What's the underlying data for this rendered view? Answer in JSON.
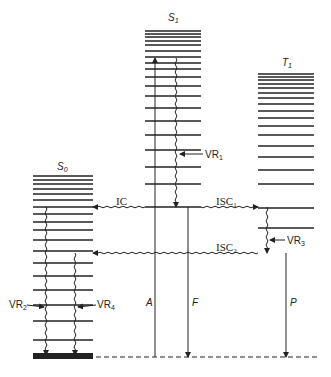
{
  "diagram": {
    "type": "jablonski",
    "colors": {
      "line": "#222222",
      "background": "#ffffff"
    },
    "states": [
      {
        "id": "S0",
        "label": "S",
        "sub": "0",
        "x1": 33,
        "x2": 93,
        "levels": [
          176,
          180,
          184,
          189,
          194,
          200,
          207,
          214,
          222,
          230,
          240,
          251,
          263,
          276,
          290,
          305,
          321,
          340
        ],
        "ground": 355,
        "ground_thick": true
      },
      {
        "id": "S1",
        "label": "S",
        "sub": "1",
        "x1": 145,
        "x2": 201,
        "levels": [
          31,
          34,
          37,
          41,
          45,
          51,
          57,
          63,
          69,
          77,
          86,
          96,
          108,
          121,
          135,
          150,
          167,
          184,
          207
        ]
      },
      {
        "id": "T1",
        "label": "T",
        "sub": "1",
        "x1": 258,
        "x2": 314,
        "levels": [
          74,
          77,
          80,
          84,
          88,
          93,
          98,
          104,
          111,
          118,
          126,
          135,
          146,
          157,
          170,
          184,
          208,
          228
        ]
      }
    ],
    "baseline_y": 357,
    "labels": {
      "s0": "S",
      "s0_sub": "0",
      "s1": "S",
      "s1_sub": "1",
      "t1": "T",
      "t1_sub": "1",
      "vr1": "VR",
      "vr1_sub": "1",
      "vr2": "VR",
      "vr2_sub": "2",
      "vr3": "VR",
      "vr3_sub": "3",
      "vr4": "VR",
      "vr4_sub": "4",
      "ic": "IC",
      "isc1": "ISC",
      "isc1_sub": "1",
      "isc2": "ISC",
      "isc2_sub": "2",
      "absorption": "A",
      "fluorescence": "F",
      "phosphorescence": "P"
    },
    "transitions": [
      {
        "name": "absorption",
        "label": "A",
        "kind": "straight",
        "from_y": 357,
        "to_y": 58,
        "x": 155
      },
      {
        "name": "vr1",
        "label": "VR1",
        "kind": "wavy",
        "from_y": 58,
        "to_y": 207,
        "x": 176
      },
      {
        "name": "ic",
        "label": "IC",
        "kind": "wavy",
        "from_x": 145,
        "to_x": 93,
        "y": 207
      },
      {
        "name": "isc1",
        "label": "ISC1",
        "kind": "wavy",
        "from_x": 201,
        "to_x": 258,
        "y": 207
      },
      {
        "name": "fluorescence",
        "label": "F",
        "kind": "straight",
        "from_y": 207,
        "to_y": 357,
        "x": 188
      },
      {
        "name": "vr3",
        "label": "VR3",
        "kind": "wavy",
        "from_y": 207,
        "to_y": 253,
        "x": 267
      },
      {
        "name": "isc2",
        "label": "ISC2",
        "kind": "wavy",
        "from_x": 258,
        "to_x": 93,
        "y": 253
      },
      {
        "name": "phosphorescence",
        "label": "P",
        "kind": "straight",
        "from_y": 253,
        "to_y": 357,
        "x": 286
      },
      {
        "name": "vr2",
        "label": "VR2",
        "kind": "wavy",
        "from_y": 207,
        "to_y": 355,
        "x": 46
      },
      {
        "name": "vr4",
        "label": "VR4",
        "kind": "wavy",
        "from_y": 253,
        "to_y": 355,
        "x": 75
      }
    ]
  }
}
